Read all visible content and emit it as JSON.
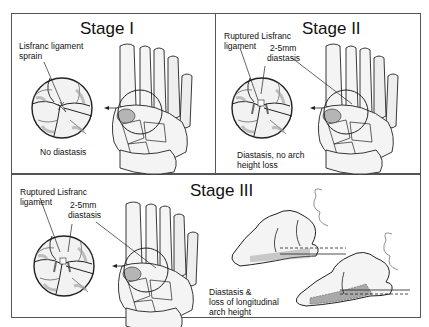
{
  "figure": {
    "panels": [
      {
        "id": "stage-1",
        "title": "Stage I",
        "labels": {
          "ligament": "Lisfranc ligament sprain",
          "ligament_line1": "Lisfranc ligament",
          "ligament_line2": "sprain",
          "finding": "No diastasis"
        }
      },
      {
        "id": "stage-2",
        "title": "Stage II",
        "labels": {
          "ligament_line1": "Ruptured Lisfranc",
          "ligament_line2": "ligament",
          "diastasis_line1": "2-5mm",
          "diastasis_line2": "diastasis",
          "finding_line1": "Diastasis, no arch",
          "finding_line2": "height loss"
        }
      },
      {
        "id": "stage-3",
        "title": "Stage III",
        "labels": {
          "ligament_line1": "Ruptured Lisfranc",
          "ligament_line2": "ligament",
          "diastasis_line1": "2-5mm",
          "diastasis_line2": "diastasis",
          "finding_line1": "Diastasis &",
          "finding_line2": "loss of longitudinal",
          "finding_line3": "arch height"
        }
      }
    ],
    "colors": {
      "line": "#222222",
      "bone_fill": "#f4f4f4",
      "shade": "#9a9a9a",
      "frame": "#555555"
    }
  }
}
